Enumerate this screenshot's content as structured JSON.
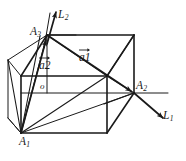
{
  "figure": {
    "type": "geometry-diagram",
    "background_color": "#ffffff",
    "line_color": "#1a1a1a",
    "labels": {
      "vertex_a1": {
        "base": "A",
        "sub": "1"
      },
      "vertex_a2": {
        "base": "A",
        "sub": "2"
      },
      "vertex_a3": {
        "base": "A",
        "sub": "3"
      },
      "axis_l1": {
        "base": "L",
        "sub": "1"
      },
      "axis_l2": {
        "base": "L",
        "sub": "2"
      },
      "vector_a1": {
        "base": "a",
        "sub": "1"
      },
      "vector_a2": {
        "base": "a",
        "sub": "2"
      },
      "origin": {
        "base": "o",
        "sub": ""
      }
    }
  }
}
